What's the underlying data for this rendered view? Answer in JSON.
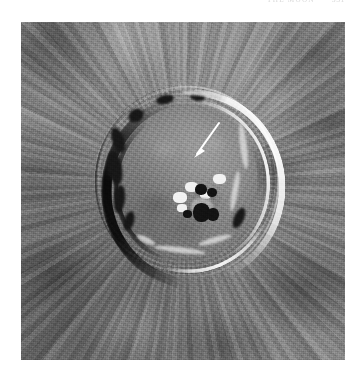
{
  "page": {
    "running_head": "THE MOON",
    "folio": "331",
    "background_color": "#ffffff",
    "header_text_color": "#d8d8d8"
  },
  "figure": {
    "name": "lunar-crater-photograph",
    "image_type": "grayscale photograph",
    "frame": {
      "x": 21,
      "y": 22,
      "width": 324,
      "height": 338
    },
    "illumination": {
      "sun_direction": "upper-right",
      "lit_side": "east / southeast rim",
      "shadowed_side": "west / northwest rim"
    },
    "features": {
      "crater_rim": {
        "name": "terraced-crater-rim",
        "center_x": 182,
        "center_y": 185,
        "radius_x": 88,
        "radius_y": 92
      },
      "central_peak": {
        "name": "central-peak-cluster",
        "center_x": 185,
        "center_y": 180,
        "description": "cluster of sunlit massifs with deep shadows"
      },
      "ejecta": {
        "name": "radial-ejecta-blanket",
        "description": "radially striated ejecta surrounding the rim"
      }
    },
    "annotation": {
      "name": "pointer-arrow",
      "type": "arrow",
      "color": "#ffffff",
      "tail_x": 219,
      "tail_y": 123,
      "head_x": 194,
      "head_y": 156,
      "points_at": "central-peak-cluster"
    },
    "colors": {
      "regolith_mid": "#878787",
      "highlight": "#f2f2f2",
      "shadow": "#121212"
    }
  }
}
